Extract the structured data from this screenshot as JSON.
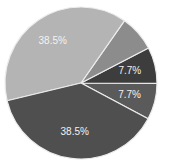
{
  "chart_data": {
    "type": "pie",
    "title": "",
    "legend": null,
    "start_angle_deg": -28,
    "direction": "counterclockwise",
    "slices": [
      {
        "label": "7.7%",
        "value": 7.7,
        "color": "#5a5a5a",
        "show_label": true
      },
      {
        "label": "7.7%",
        "value": 7.7,
        "color": "#3d3d3d",
        "show_label": true
      },
      {
        "label": "7.7%",
        "value": 7.7,
        "color": "#8c8c8c",
        "show_label": false
      },
      {
        "label": "38.5%",
        "value": 38.5,
        "color": "#b4b4b4",
        "show_label": true
      },
      {
        "label": "38.5%",
        "value": 38.5,
        "color": "#4f4f4f",
        "show_label": true
      }
    ],
    "values": [
      7.7,
      7.7,
      7.7,
      38.5,
      38.5
    ],
    "categories": [
      "",
      "",
      "",
      "",
      ""
    ]
  },
  "geometry": {
    "cx": 81,
    "cy": 83,
    "r": 76,
    "label_radius_ratio": 0.66
  }
}
